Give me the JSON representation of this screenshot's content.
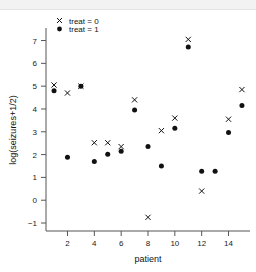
{
  "chart_data": {
    "type": "scatter",
    "title": "",
    "xlabel": "patient",
    "ylabel": "log(seizures+1/2)",
    "xlim": [
      0.4,
      15.6
    ],
    "ylim": [
      -1.35,
      7.55
    ],
    "xticks": [
      2,
      4,
      6,
      8,
      10,
      12,
      14
    ],
    "yticks": [
      -1,
      0,
      1,
      2,
      3,
      4,
      5,
      6,
      7
    ],
    "grid": false,
    "legend_position": "top-left",
    "x": [
      1,
      2,
      3,
      4,
      5,
      6,
      7,
      8,
      9,
      10,
      11,
      12,
      13,
      14,
      15
    ],
    "series": [
      {
        "name": "treat = 0",
        "marker": "cross",
        "color": "#111111",
        "values": [
          5.05,
          4.7,
          5.0,
          2.52,
          2.52,
          2.35,
          4.4,
          -0.75,
          3.05,
          3.6,
          7.05,
          0.4,
          null,
          3.55,
          4.85
        ]
      },
      {
        "name": "treat = 1",
        "marker": "dot",
        "color": "#111111",
        "values": [
          4.8,
          1.88,
          5.0,
          1.7,
          2.02,
          2.15,
          3.95,
          2.35,
          1.5,
          3.15,
          6.72,
          1.27,
          1.27,
          2.97,
          4.15
        ]
      }
    ]
  },
  "legend": {
    "entries": [
      {
        "label": "treat = 0",
        "marker": "cross"
      },
      {
        "label": "treat = 1",
        "marker": "dot"
      }
    ]
  },
  "axes": {
    "x_title": "patient",
    "y_title": "log(seizures+1/2)",
    "x_tick_labels": [
      "2",
      "4",
      "6",
      "8",
      "10",
      "12",
      "14"
    ],
    "y_tick_labels": [
      "7",
      "6",
      "5",
      "4",
      "3",
      "2",
      "1",
      "0",
      "−1"
    ]
  },
  "colors": {
    "marker": "#111111",
    "axis": "#555555",
    "text": "#111111",
    "background": "#ffffff",
    "top_band": "#f2f2f2"
  }
}
